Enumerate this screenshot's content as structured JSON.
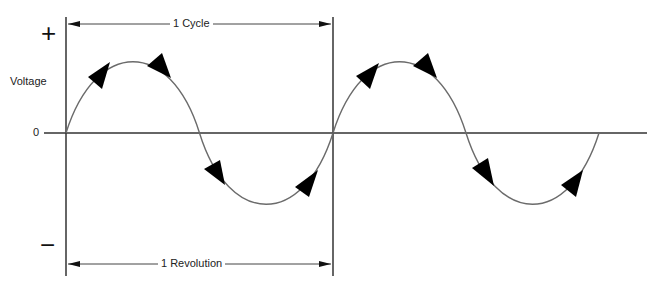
{
  "diagram": {
    "y_axis_label": "Voltage",
    "plus_symbol": "+",
    "minus_symbol": "−",
    "zero_label": "0",
    "top_dimension_label": "1 Cycle",
    "bottom_dimension_label": "1 Revolution",
    "cycles_shown": 2,
    "direction_arrows_per_cycle": 4,
    "colors": {
      "wave": "#6b6b6b",
      "axis": "#333333",
      "arrow": "#000000"
    }
  }
}
